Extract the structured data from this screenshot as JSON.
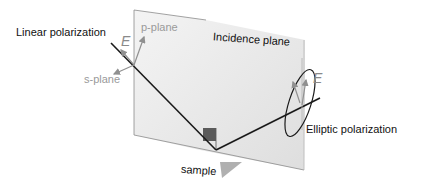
{
  "labels": {
    "linear": "Linear polarization",
    "p_plane": "p-plane",
    "s_plane": "s-plane",
    "incidence": "Incidence plane",
    "e_left": "E",
    "e_right": "E",
    "elliptic": "Elliptic polarization",
    "sample": "sample"
  },
  "colors": {
    "plane_fill": "#e6e6e6",
    "plane_edge": "#8c8c8c",
    "beam": "#1a1a1a",
    "vector": "#909090",
    "sample_wedge": "#b0b0b0",
    "marker": "#5a5a5a"
  }
}
